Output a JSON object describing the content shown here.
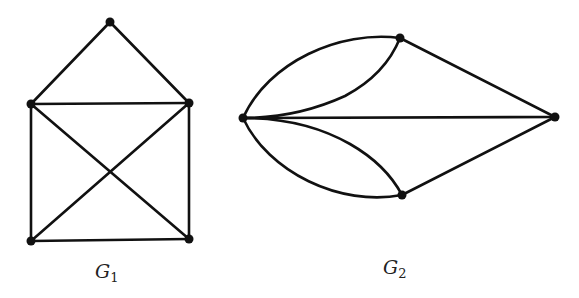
{
  "figure": {
    "graphs": [
      {
        "id": "g1",
        "label_main": "G",
        "label_sub": "1",
        "vertices": [
          {
            "name": "top",
            "x": 110,
            "y": 22
          },
          {
            "name": "mid-left",
            "x": 31,
            "y": 104
          },
          {
            "name": "mid-right",
            "x": 189,
            "y": 103
          },
          {
            "name": "bottom-left",
            "x": 31,
            "y": 241
          },
          {
            "name": "bottom-right",
            "x": 189,
            "y": 239
          }
        ],
        "edges": [
          [
            "top",
            "mid-left"
          ],
          [
            "top",
            "mid-right"
          ],
          [
            "mid-left",
            "mid-right"
          ],
          [
            "mid-left",
            "bottom-left"
          ],
          [
            "mid-right",
            "bottom-right"
          ],
          [
            "bottom-left",
            "bottom-right"
          ],
          [
            "mid-left",
            "bottom-right"
          ],
          [
            "mid-right",
            "bottom-left"
          ]
        ]
      },
      {
        "id": "g2",
        "label_main": "G",
        "label_sub": "2",
        "vertices": [
          {
            "name": "left",
            "x": 243,
            "y": 118
          },
          {
            "name": "top",
            "x": 400,
            "y": 38
          },
          {
            "name": "right",
            "x": 555,
            "y": 117
          },
          {
            "name": "bottom",
            "x": 402,
            "y": 195
          }
        ],
        "edges": [
          [
            "left",
            "top",
            "outer-arc"
          ],
          [
            "left",
            "top",
            "inner-arc"
          ],
          [
            "left",
            "bottom",
            "outer-arc"
          ],
          [
            "left",
            "bottom",
            "inner-arc"
          ],
          [
            "left",
            "right",
            "straight"
          ],
          [
            "top",
            "right",
            "straight"
          ],
          [
            "bottom",
            "right",
            "straight"
          ]
        ]
      }
    ],
    "colors": {
      "stroke": "#111111",
      "background": "#ffffff"
    }
  }
}
